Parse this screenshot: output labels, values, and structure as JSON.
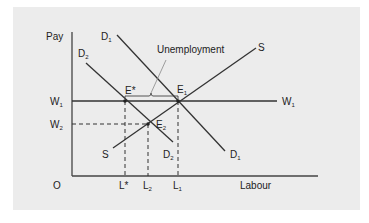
{
  "diagram": {
    "type": "labour-market-supply-demand",
    "axes": {
      "y_label": "Pay",
      "x_label": "Labour",
      "origin_label": "O"
    },
    "wage_levels": [
      {
        "id": "W1",
        "label": "W",
        "sub": "1",
        "right_label": "W",
        "right_sub": "1"
      },
      {
        "id": "W2",
        "label": "W",
        "sub": "2"
      }
    ],
    "quantity_levels": [
      {
        "id": "Lstar",
        "label": "L*"
      },
      {
        "id": "L2",
        "label": "L",
        "sub": "2"
      },
      {
        "id": "L1",
        "label": "L",
        "sub": "1"
      }
    ],
    "curves": [
      {
        "id": "S",
        "label_top": "S",
        "label_bottom": "S"
      },
      {
        "id": "D1",
        "label": "D",
        "sub": "1"
      },
      {
        "id": "D2",
        "label": "D",
        "sub": "2"
      }
    ],
    "points": [
      {
        "id": "Estar",
        "label": "E*"
      },
      {
        "id": "E1",
        "label": "E",
        "sub": "1"
      },
      {
        "id": "E2",
        "label": "E",
        "sub": "2"
      }
    ],
    "annotation": {
      "label": "Unemployment"
    },
    "colors": {
      "background": "#ececec",
      "line": "#333333",
      "text": "#222222"
    }
  }
}
